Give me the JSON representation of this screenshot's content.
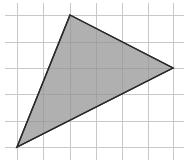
{
  "figure": {
    "width": 184,
    "height": 167,
    "background_color": "#ffffff",
    "grid": {
      "color": "#c8c8c8",
      "vertical_lines_x": [
        17,
        43,
        70,
        96,
        122,
        148,
        173
      ],
      "horizontal_lines_y": [
        15,
        42,
        68,
        94,
        121,
        147
      ],
      "vertical_extent": [
        3,
        160
      ],
      "horizontal_extent": [
        5,
        184
      ]
    },
    "triangle": {
      "fill_color": "#b0b0b0",
      "stroke_color": "#2a2a2a",
      "stroke_width": 1.4,
      "vertices": [
        {
          "name": "top",
          "x": 70,
          "y": 15,
          "grid_col": 2,
          "grid_row": 0
        },
        {
          "name": "right",
          "x": 173,
          "y": 68,
          "grid_col": 6,
          "grid_row": 2
        },
        {
          "name": "bottom-left",
          "x": 17,
          "y": 147,
          "grid_col": 0,
          "grid_row": 5
        }
      ]
    }
  }
}
